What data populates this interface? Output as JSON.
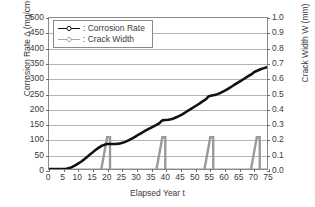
{
  "chart_data": {
    "type": "line",
    "title": "",
    "xlabel": "Elapsed Year t",
    "ylabel": "Corrosion Rate Δ (mg/cm",
    "ylabel_sup": "2",
    "ylabel_tail": ")",
    "y2label": "Crack Width W (mm)",
    "xlim": [
      0,
      75
    ],
    "ylim": [
      0,
      500
    ],
    "y2lim": [
      0.0,
      1.0
    ],
    "grid": true,
    "legend_position": "top-left-inside",
    "xticks": [
      "0",
      "5",
      "10",
      "15",
      "20",
      "25",
      "30",
      "35",
      "40",
      "45",
      "50",
      "55",
      "60",
      "65",
      "70",
      "75"
    ],
    "xtick_values": [
      0,
      5,
      10,
      15,
      20,
      25,
      30,
      35,
      40,
      45,
      50,
      55,
      60,
      65,
      70,
      75
    ],
    "yticks": [
      "0",
      "50",
      "100",
      "150",
      "200",
      "250",
      "300",
      "350",
      "400",
      "450",
      "500"
    ],
    "ytick_values": [
      0,
      50,
      100,
      150,
      200,
      250,
      300,
      350,
      400,
      450,
      500
    ],
    "y2ticks": [
      "0.0",
      "0.1",
      "0.2",
      "0.3",
      "0.4",
      "0.5",
      "0.6",
      "0.7",
      "0.8",
      "0.9",
      "1.0"
    ],
    "y2tick_values": [
      0.0,
      0.1,
      0.2,
      0.3,
      0.4,
      0.5,
      0.6,
      0.7,
      0.8,
      0.9,
      1.0
    ],
    "series": [
      {
        "name": "Corrosion Rate",
        "axis": "left",
        "color": "#111111",
        "marker": "open-circle",
        "x": [
          0,
          2,
          4,
          6,
          7,
          8,
          9,
          10,
          11,
          12,
          13,
          14,
          15,
          16,
          17,
          18,
          19,
          19.5,
          20,
          21,
          22,
          23,
          24,
          25,
          26,
          27,
          28,
          29,
          30,
          31,
          32,
          33,
          34,
          35,
          36,
          37,
          38,
          38.5,
          39,
          40,
          41,
          42,
          43,
          44,
          45,
          46,
          47,
          48,
          49,
          50,
          51,
          52,
          53,
          54,
          54.5,
          55,
          56,
          57,
          58,
          59,
          60,
          61,
          62,
          63,
          64,
          65,
          66,
          67,
          68,
          69,
          70,
          70.5,
          71,
          72,
          73,
          74,
          75
        ],
        "y": [
          0,
          0,
          0,
          1,
          3,
          7,
          12,
          18,
          24,
          31,
          39,
          47,
          55,
          63,
          70,
          76,
          80,
          82,
          83,
          83,
          83,
          83,
          84,
          86,
          89,
          93,
          98,
          103,
          109,
          115,
          120,
          126,
          131,
          136,
          141,
          146,
          152,
          157,
          161,
          162,
          163,
          165,
          168,
          172,
          177,
          182,
          188,
          194,
          200,
          206,
          212,
          218,
          225,
          231,
          236,
          241,
          243,
          245,
          248,
          252,
          257,
          262,
          268,
          274,
          280,
          286,
          292,
          298,
          304,
          310,
          316,
          320,
          323,
          327,
          331,
          334,
          337
        ]
      },
      {
        "name": "Crack Width",
        "axis": "right",
        "color": "#9a9a9a",
        "marker": "open-circle",
        "description": "Sawtooth: rises steeply to ~0.21 mm then drops vertically to 0 at each crack event",
        "events": [
          {
            "start": 18.0,
            "peak_x": 20.0,
            "peak_y": 0.21,
            "drop_to": 21.0
          },
          {
            "start": 37.0,
            "peak_x": 39.0,
            "peak_y": 0.21,
            "drop_to": 40.0
          },
          {
            "start": 53.5,
            "peak_x": 55.5,
            "peak_y": 0.21,
            "drop_to": 56.5
          },
          {
            "start": 69.5,
            "peak_x": 71.5,
            "peak_y": 0.21,
            "drop_to": 72.5
          }
        ],
        "baseline": 0.0
      }
    ],
    "legend": [
      {
        "label": ": Corrosion Rate",
        "key": "black-line-open-circle"
      },
      {
        "label": ": Crack Width",
        "key": "gray-line-open-circle"
      }
    ]
  },
  "colors": {
    "corrosion": "#111111",
    "crack": "#9a9a9a",
    "grid": "#b4b4b4",
    "frame": "#8a8a8a",
    "text": "#3b3b3b",
    "background": "#ffffff"
  }
}
